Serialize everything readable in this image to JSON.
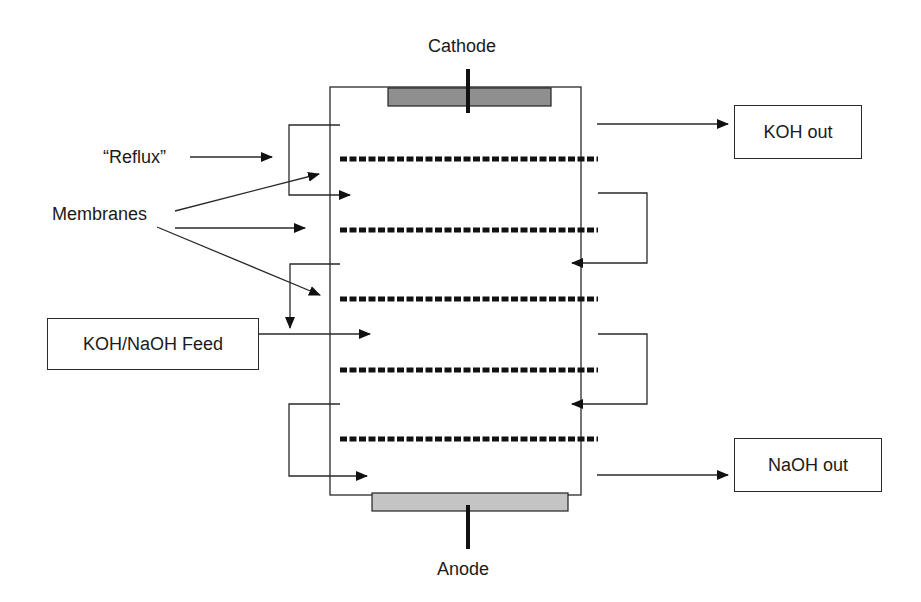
{
  "labels": {
    "cathode": "Cathode",
    "anode": "Anode",
    "reflux": "“Reflux”",
    "membranes": "Membranes"
  },
  "boxes": {
    "koh_out": "KOH out",
    "naoh_out": "NaOH out",
    "feed": "KOH/NaOH Feed"
  },
  "colors": {
    "line": "#2a2a2a",
    "cathode_plate": "#8f8f8f",
    "anode_plate": "#c4c4c4",
    "membrane": "#111111"
  },
  "membranes": {
    "count": 5,
    "y_positions": [
      159,
      230,
      299,
      370,
      439
    ]
  }
}
